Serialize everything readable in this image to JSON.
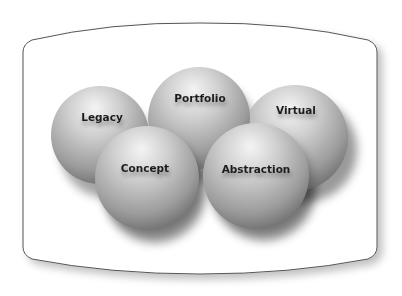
{
  "diagram": {
    "type": "grouped-spheres-in-container",
    "container": {
      "shape": "barrel",
      "stroke": "#555555",
      "fill": "#ffffff"
    },
    "spheres": [
      {
        "id": "legacy",
        "label": "Legacy",
        "cx": 100,
        "cy": 135,
        "r": 49,
        "label_x": 102,
        "label_y": 121
      },
      {
        "id": "portfolio",
        "label": "Portfolio",
        "cx": 199,
        "cy": 118,
        "r": 51,
        "label_x": 200,
        "label_y": 102
      },
      {
        "id": "virtual",
        "label": "Virtual",
        "cx": 295,
        "cy": 138,
        "r": 53,
        "label_x": 295,
        "label_y": 114
      },
      {
        "id": "concept",
        "label": "Concept",
        "cx": 147,
        "cy": 178,
        "r": 52,
        "label_x": 145,
        "label_y": 172
      },
      {
        "id": "abstraction",
        "label": "Abstraction",
        "cx": 256,
        "cy": 176,
        "r": 53,
        "label_x": 256,
        "label_y": 173
      }
    ],
    "colors": {
      "sphere_highlight": "#f2f2f2",
      "sphere_mid": "#b4b4b4",
      "sphere_dark": "#6e6e6e",
      "label": "#1e1e1e"
    }
  }
}
